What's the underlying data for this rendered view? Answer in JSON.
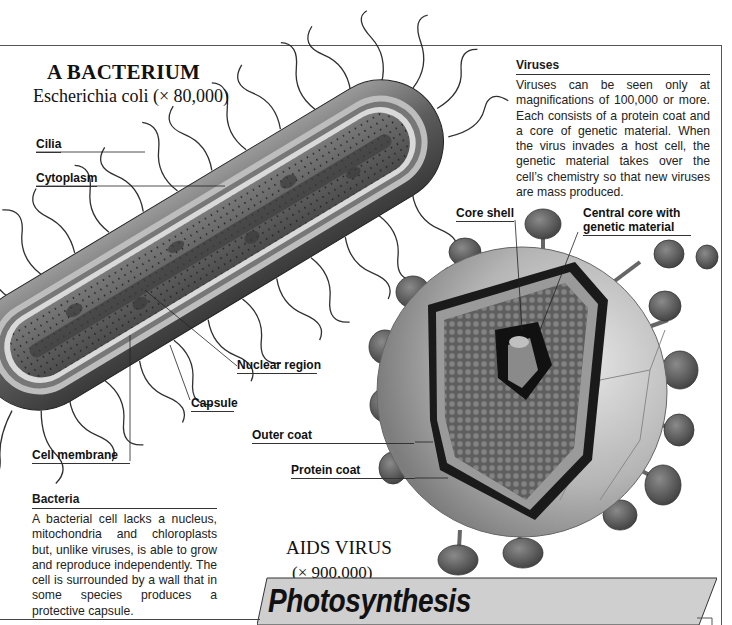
{
  "bacterium": {
    "title": "A BACTERIUM",
    "subtitle": "Escherichia coli (× 80,000)",
    "labels": {
      "cilia": "Cilia",
      "cytoplasm": "Cytoplasm",
      "nuclear_region": "Nuclear region",
      "capsule": "Capsule",
      "cell_membrane": "Cell membrane"
    }
  },
  "virus": {
    "title": "AIDS VIRUS",
    "subtitle": "(× 900,000)",
    "labels": {
      "core_shell": "Core shell",
      "central_core": "Central core with genetic material",
      "outer_coat": "Outer coat",
      "protein_coat": "Protein coat"
    }
  },
  "viruses_box": {
    "heading": "Viruses",
    "body": "Viruses can be seen only at magnifications of 100,000 or more. Each consists of a protein coat and a core of genetic material. When the virus invades a host cell, the genetic material takes over the cell’s chemistry so that new viruses are mass produced."
  },
  "bacteria_box": {
    "heading": "Bacteria",
    "body": "A bacterial cell lacks a nucleus, mitochondria and chloroplasts but, unlike viruses, is able to grow and reproduce independently. The cell is surrounded by a wall that in some species produces a protective capsule."
  },
  "section_banner": {
    "title": "Photosynthesis"
  },
  "colors": {
    "ink": "#111111",
    "banner_fill": "#cfcfcf",
    "bacterium_body": "#6e6e6e",
    "virus_particle": "#5a5a5a",
    "virus_sphere": "#b8b8b8"
  }
}
